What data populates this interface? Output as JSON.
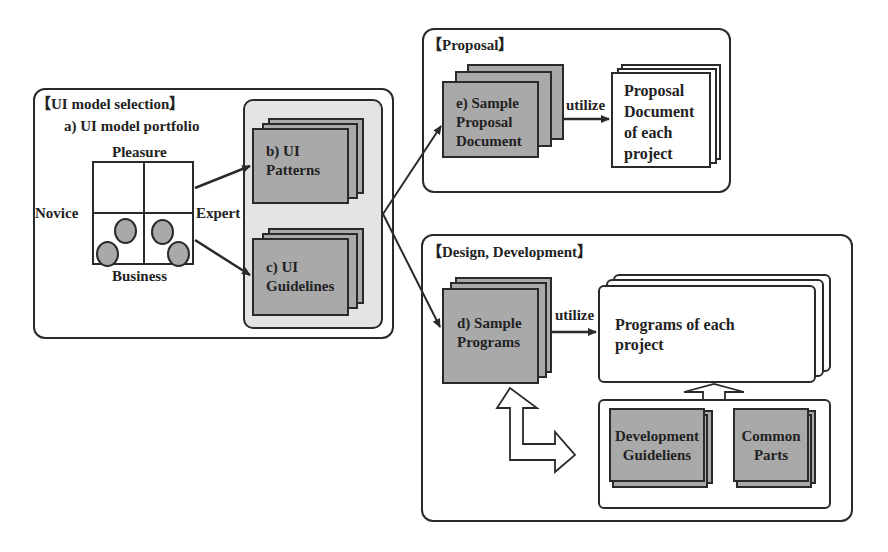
{
  "ui_model_selection": {
    "title": "【UI model selection】",
    "portfolio_title": "a) UI model portfolio",
    "axis_top": "Pleasure",
    "axis_bottom": "Business",
    "axis_left": "Novice",
    "axis_right": "Expert",
    "ui_patterns": [
      "b) UI",
      "Patterns"
    ],
    "ui_guidelines": [
      "c) UI",
      "Guidelines"
    ]
  },
  "proposal": {
    "title": "【Proposal】",
    "sample_doc": [
      "e) Sample",
      "Proposal",
      "Document"
    ],
    "utilize_label": "utilize",
    "output_doc": [
      "Proposal",
      "Document",
      "of each",
      "project"
    ]
  },
  "design_development": {
    "title": "【Design, Development】",
    "sample_programs": [
      "d) Sample",
      "Programs"
    ],
    "utilize_label": "utilize",
    "output_programs": [
      "Programs of each",
      "project"
    ],
    "dev_guidelines": [
      "Development",
      "Guideliens"
    ],
    "common_parts": [
      "Common",
      "Parts"
    ]
  },
  "colors": {
    "gray_doc": "#a9a9a9",
    "panel_bg": "#e4e4e4",
    "stroke": "#2a2a2a"
  }
}
